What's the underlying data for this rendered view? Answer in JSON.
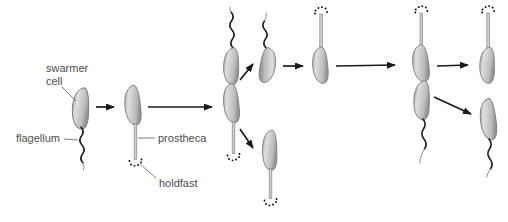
{
  "figure": {
    "labels": {
      "swarmer_line1": "swarmer",
      "swarmer_line2": "cell",
      "flagellum": "flagellum",
      "prostheca": "prostheca",
      "holdfast": "holdfast"
    },
    "colors": {
      "background": "#ffffff",
      "cell_fill_light": "#dedede",
      "cell_fill_mid": "#c6c6c6",
      "cell_fill_dark": "#9c9c9c",
      "cell_outline": "#7f7f7f",
      "stalk_fill": "#cfcfcf",
      "stalk_outline": "#878787",
      "flagellum": "#1c1c1c",
      "holdfast": "#2a2a2a",
      "arrow": "#1a1a1a",
      "label_text": "#4c4c4e",
      "leader_line": "#707072"
    }
  }
}
